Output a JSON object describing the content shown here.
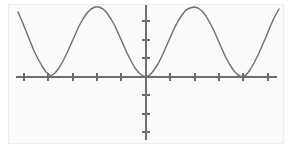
{
  "figure": {
    "title": "",
    "background_color": "#ffffff",
    "plot_background_color": "#fbfaf8",
    "frame_color": "#ececea",
    "axis_color": "#6d6d6d",
    "curve_color": "#6f6f6f"
  },
  "geometry": {
    "width": 292,
    "height": 156,
    "origin_x": 146,
    "origin_y": 77,
    "x_axis_start": 16,
    "x_axis_end": 277,
    "y_axis_top": 5,
    "y_axis_bottom": 140,
    "x_tick_spacing": 24.5,
    "y_tick_spacing": 18.5,
    "tick_half_length": 4,
    "curve_top_y": 7,
    "curve_left_x": 18,
    "curve_right_x": 279
  },
  "chart_data": {
    "type": "line",
    "title": "",
    "xlabel": "",
    "ylabel": "",
    "grid": false,
    "legend": null,
    "function": "y = 1 - cos(pi * x)",
    "amplitude": 2,
    "period_px": 95,
    "period_units": 2,
    "xlim": [
      -2.65,
      2.67
    ],
    "ylim": [
      -3.4,
      3.9
    ],
    "x_ticks": [
      -5,
      -4,
      -3,
      -2,
      -1,
      0,
      1,
      2,
      3,
      4,
      5
    ],
    "x_tick_px": [
      24,
      48,
      73,
      97,
      121,
      146,
      170,
      195,
      219,
      243,
      268
    ],
    "y_ticks": [
      -3,
      -2,
      -1,
      0,
      1,
      2,
      3
    ],
    "y_tick_px": [
      132,
      114,
      95,
      77,
      58,
      40,
      21
    ],
    "key_points": [
      {
        "label": "minimum",
        "x_px": 51,
        "y_px": 77,
        "x": -2,
        "y": 0
      },
      {
        "label": "maximum",
        "x_px": 98,
        "y_px": 7,
        "x": -1,
        "y": 2
      },
      {
        "label": "minimum",
        "x_px": 146,
        "y_px": 77,
        "x": 0,
        "y": 0
      },
      {
        "label": "maximum",
        "x_px": 194,
        "y_px": 7,
        "x": 1,
        "y": 2
      },
      {
        "label": "minimum",
        "x_px": 242,
        "y_px": 77,
        "x": 2,
        "y": 0
      }
    ],
    "series": [
      {
        "name": "wave",
        "color": "#6f6f6f",
        "points_px": [
          [
            18,
            12
          ],
          [
            22,
            21
          ],
          [
            26,
            31
          ],
          [
            30,
            41
          ],
          [
            34,
            51
          ],
          [
            38,
            59
          ],
          [
            42,
            66
          ],
          [
            46,
            72
          ],
          [
            51,
            76
          ],
          [
            55,
            73
          ],
          [
            59,
            68
          ],
          [
            63,
            61
          ],
          [
            67,
            53
          ],
          [
            71,
            44
          ],
          [
            75,
            35
          ],
          [
            79,
            26
          ],
          [
            83,
            19
          ],
          [
            87,
            13
          ],
          [
            91,
            9
          ],
          [
            95,
            7
          ],
          [
            99,
            7
          ],
          [
            103,
            9
          ],
          [
            107,
            13
          ],
          [
            111,
            19
          ],
          [
            115,
            26
          ],
          [
            119,
            35
          ],
          [
            123,
            44
          ],
          [
            127,
            53
          ],
          [
            131,
            61
          ],
          [
            135,
            68
          ],
          [
            139,
            73
          ],
          [
            143,
            76
          ],
          [
            146,
            77
          ],
          [
            150,
            75
          ],
          [
            154,
            70
          ],
          [
            158,
            64
          ],
          [
            162,
            56
          ],
          [
            166,
            47
          ],
          [
            170,
            38
          ],
          [
            174,
            29
          ],
          [
            178,
            21
          ],
          [
            182,
            15
          ],
          [
            186,
            10
          ],
          [
            190,
            8
          ],
          [
            194,
            7
          ],
          [
            198,
            8
          ],
          [
            202,
            11
          ],
          [
            206,
            16
          ],
          [
            210,
            23
          ],
          [
            214,
            31
          ],
          [
            218,
            40
          ],
          [
            222,
            49
          ],
          [
            226,
            58
          ],
          [
            230,
            65
          ],
          [
            234,
            71
          ],
          [
            238,
            75
          ],
          [
            242,
            77
          ],
          [
            246,
            75
          ],
          [
            250,
            70
          ],
          [
            254,
            63
          ],
          [
            258,
            55
          ],
          [
            262,
            46
          ],
          [
            266,
            37
          ],
          [
            270,
            27
          ],
          [
            274,
            18
          ],
          [
            279,
            9
          ]
        ]
      }
    ]
  },
  "elements": {
    "x_axis_name": "horizontal-axis",
    "y_axis_name": "vertical-axis",
    "curve_name": "cosine-wave-curve",
    "frame_name": "plot-frame"
  }
}
